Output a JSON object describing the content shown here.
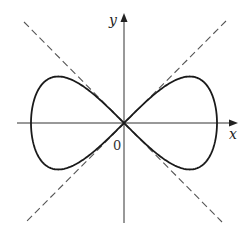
{
  "figure": {
    "axes": {
      "x_label": "x",
      "y_label": "y",
      "origin_label": "0"
    },
    "colors": {
      "curve": "#1a1a1a",
      "axes": "#333333",
      "dashed": "#555555",
      "background": "#ffffff"
    }
  },
  "chart_data": {
    "type": "line",
    "title": "",
    "xlabel": "x",
    "ylabel": "y",
    "series": [
      {
        "name": "curve",
        "equation": "y^2 = x^2 - x^4",
        "style": "solid"
      },
      {
        "name": "tangent y=x",
        "equation": "y = x",
        "style": "dashed"
      },
      {
        "name": "tangent y=-x",
        "equation": "y = -x",
        "style": "dashed"
      }
    ],
    "xlim": [
      -1.15,
      1.2
    ],
    "ylim": [
      -1.08,
      1.18
    ],
    "grid": false,
    "annotations": [
      "0"
    ]
  }
}
